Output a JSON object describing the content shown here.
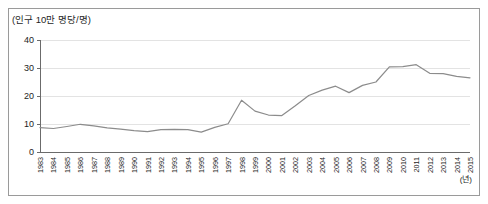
{
  "figure": {
    "border_color": "#9a9a9a",
    "background": "#ffffff"
  },
  "axis": {
    "y_label": "(인구 10만 명당/명)",
    "x_unit_label": "(년)",
    "y_ticks": [
      "0",
      "10",
      "20",
      "30",
      "40"
    ],
    "grid_color": "#e3e3e3",
    "axis_color": "#6b6b6b"
  },
  "chart_data": {
    "type": "line",
    "title": "",
    "subtitle": "",
    "xlabel": "(년)",
    "ylabel": "(인구 10만 명당/명)",
    "ylim": [
      0,
      40
    ],
    "yticks": [
      0,
      10,
      20,
      30,
      40
    ],
    "grid": true,
    "legend": false,
    "line_color": "#8c8c8c",
    "categories": [
      "1983",
      "1984",
      "1985",
      "1986",
      "1987",
      "1988",
      "1989",
      "1990",
      "1991",
      "1992",
      "1993",
      "1994",
      "1995",
      "1996",
      "1997",
      "1998",
      "1999",
      "2000",
      "2001",
      "2002",
      "2003",
      "2004",
      "2005",
      "2006",
      "2007",
      "2008",
      "2009",
      "2010",
      "2011",
      "2012",
      "2013",
      "2014",
      "2015"
    ],
    "series": [
      {
        "name": "자살률",
        "values": [
          8.7,
          8.4,
          9.1,
          9.9,
          9.3,
          8.6,
          8.2,
          7.6,
          7.3,
          8.0,
          8.1,
          8.0,
          7.1,
          8.8,
          10.1,
          18.5,
          14.6,
          13.2,
          13.0,
          16.5,
          20.2,
          22.1,
          23.5,
          21.2,
          23.8,
          25.0,
          30.4,
          30.5,
          31.2,
          28.1,
          28.0,
          27.0,
          26.5
        ]
      }
    ]
  }
}
